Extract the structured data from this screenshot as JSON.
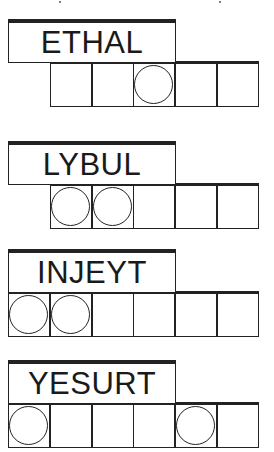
{
  "puzzles": [
    {
      "scrambled": "ETHAL",
      "top": 19,
      "cell_offset": 1,
      "cells": 5,
      "circled": [
        2
      ]
    },
    {
      "scrambled": "LYBUL",
      "top": 141,
      "cell_offset": 1,
      "cells": 5,
      "circled": [
        0,
        1
      ]
    },
    {
      "scrambled": "INJEYT",
      "top": 249,
      "cell_offset": 0,
      "cells": 6,
      "circled": [
        0,
        1
      ]
    },
    {
      "scrambled": "YESURT",
      "top": 360,
      "cell_offset": 0,
      "cells": 6,
      "circled": [
        0,
        4
      ]
    }
  ],
  "colors": {
    "ink": "#222222",
    "background": "#ffffff"
  }
}
